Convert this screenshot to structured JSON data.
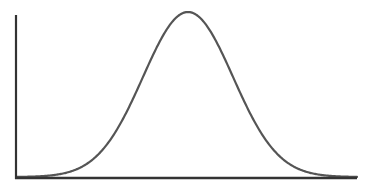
{
  "chart_data": {
    "type": "line",
    "title": "",
    "subtitle": "",
    "xlabel": "",
    "ylabel": "",
    "distribution": {
      "name": "normal",
      "mean": 0,
      "std": 1
    },
    "x": [
      -3.5,
      -3,
      -2.5,
      -2,
      -1.5,
      -1,
      -0.5,
      0,
      0.5,
      1,
      1.5,
      2,
      2.5,
      3,
      3.5
    ],
    "series": [
      {
        "name": "density",
        "values": [
          0.0009,
          0.0044,
          0.0175,
          0.054,
          0.1295,
          0.242,
          0.3521,
          0.3989,
          0.3521,
          0.242,
          0.1295,
          0.054,
          0.0175,
          0.0044,
          0.0009
        ],
        "color": "#555555"
      }
    ],
    "xlim": [
      -3.8,
      3.8
    ],
    "ylim": [
      0,
      0.4
    ],
    "grid": false,
    "legend": null,
    "axis_color": "#333333"
  },
  "layout": {
    "axis_left_x": 16,
    "axis_top_y": 15,
    "axis_bottom_y": 178,
    "axis_right_x": 357,
    "peak_x": 188,
    "peak_y": 13,
    "sigma_px": 45
  }
}
